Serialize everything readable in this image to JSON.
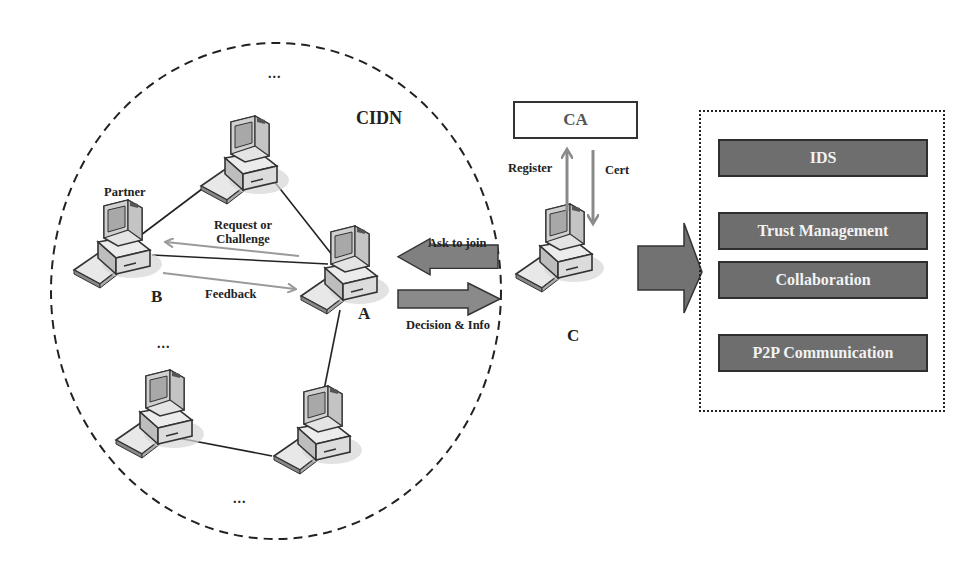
{
  "figure": {
    "network_label": "CIDN",
    "ellipsis": "...",
    "nodes": {
      "a": {
        "letter": "A"
      },
      "b": {
        "letter": "B",
        "role_label": "Partner"
      },
      "c": {
        "letter": "C"
      }
    },
    "messages": {
      "request_or_challenge": "Request or Challenge",
      "request_line1": "Request or",
      "request_line2": "Challenge",
      "feedback": "Feedback",
      "ask_to_join": "Ask to join",
      "decision_info": "Decision & Info",
      "register": "Register",
      "cert": "Cert"
    },
    "ca": {
      "label": "CA"
    },
    "modules": [
      {
        "label": "IDS"
      },
      {
        "label": "Trust Management"
      },
      {
        "label": "Collaboration"
      },
      {
        "label": "P2P Communication"
      }
    ],
    "colors": {
      "module_fill": "#6e6e6e",
      "module_border": "#2e2e2e",
      "module_text": "#f2f2f2",
      "arrow_gray": "#808080",
      "thin_arrow_gray": "#9a9a9a",
      "line": "#222222"
    }
  }
}
